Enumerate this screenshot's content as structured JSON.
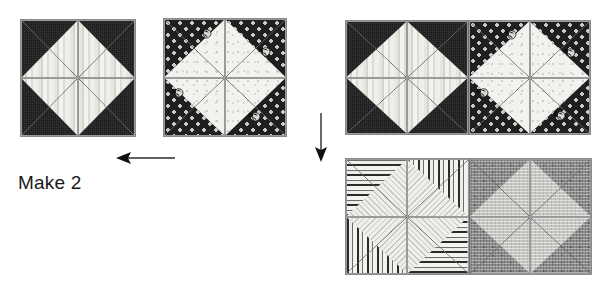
{
  "canvas": {
    "width": 602,
    "height": 288,
    "background": "#ffffff"
  },
  "instruction": {
    "label": "Make 2"
  },
  "colors": {
    "dark_solid": "#262626",
    "light_stripe": "#ebebe6",
    "dot_dark": "#1f1f1f",
    "light_speck": "#f2f2ee",
    "mottle_mid": "#8e8e8e",
    "mottle_light": "#c6c6c2",
    "seam": "#6a6a6a",
    "outline": "#8a8a8a",
    "text": "#1a1a1a",
    "arrow": "#2b2b2b"
  },
  "units": [
    {
      "id": "pinwheel-stripe",
      "name": "striped-pinwheel-block",
      "x": 20,
      "y": 19,
      "w": 116,
      "h": 118,
      "kind": "block",
      "quadrants": [
        {
          "pos": "top-left",
          "dark_corner": "tl",
          "dark_fabric": "fab-dark-solid",
          "light_fabric": "fab-light-stripe",
          "seam": "fwd",
          "motifs": []
        },
        {
          "pos": "top-right",
          "dark_corner": "tr",
          "dark_fabric": "fab-dark-solid",
          "light_fabric": "fab-light-stripe",
          "seam": "bwd",
          "motifs": []
        },
        {
          "pos": "bottom-left",
          "dark_corner": "bl",
          "dark_fabric": "fab-dark-solid",
          "light_fabric": "fab-light-stripe",
          "seam": "bwd",
          "motifs": []
        },
        {
          "pos": "bottom-right",
          "dark_corner": "br",
          "dark_fabric": "fab-dark-solid",
          "light_fabric": "fab-light-stripe",
          "seam": "fwd",
          "motifs": []
        }
      ]
    },
    {
      "id": "pinwheel-dot",
      "name": "polka-dot-pinwheel-block",
      "x": 163,
      "y": 18,
      "w": 124,
      "h": 119,
      "kind": "block",
      "quadrants": [
        {
          "pos": "top-left",
          "dark_corner": "tl",
          "dark_fabric": "fab-dot-dark",
          "light_fabric": "fab-light-speck",
          "seam": "fwd",
          "motifs": [
            {
              "x": 34,
              "y": 6
            }
          ]
        },
        {
          "pos": "top-right",
          "dark_corner": "tr",
          "dark_fabric": "fab-dot-dark",
          "light_fabric": "fab-light-speck",
          "seam": "bwd",
          "motifs": [
            {
              "x": 32,
              "y": 24
            }
          ]
        },
        {
          "pos": "bottom-left",
          "dark_corner": "bl",
          "dark_fabric": "fab-dot-dark",
          "light_fabric": "fab-light-speck",
          "seam": "bwd",
          "motifs": [
            {
              "x": 6,
              "y": 6
            }
          ]
        },
        {
          "pos": "bottom-right",
          "dark_corner": "br",
          "dark_fabric": "fab-dot-dark",
          "light_fabric": "fab-light-speck",
          "seam": "fwd",
          "motifs": [
            {
              "x": 22,
              "y": 30
            }
          ]
        }
      ]
    },
    {
      "id": "pair-top",
      "name": "joined-dark-pair-unit",
      "x": 345,
      "y": 20,
      "w": 246,
      "h": 115,
      "kind": "pair",
      "halves": [
        {
          "id": "pair-top-left",
          "name": "striped-pinwheel-half",
          "quadrants": [
            {
              "pos": "top-left",
              "dark_corner": "tl",
              "dark_fabric": "fab-dark-solid",
              "light_fabric": "fab-light-stripe",
              "seam": "fwd",
              "motifs": []
            },
            {
              "pos": "top-right",
              "dark_corner": "tr",
              "dark_fabric": "fab-dark-solid",
              "light_fabric": "fab-light-stripe",
              "seam": "bwd",
              "motifs": []
            },
            {
              "pos": "bottom-left",
              "dark_corner": "bl",
              "dark_fabric": "fab-dark-solid",
              "light_fabric": "fab-light-stripe",
              "seam": "bwd",
              "motifs": []
            },
            {
              "pos": "bottom-right",
              "dark_corner": "br",
              "dark_fabric": "fab-dark-solid",
              "light_fabric": "fab-light-stripe",
              "seam": "fwd",
              "motifs": []
            }
          ]
        },
        {
          "id": "pair-top-right",
          "name": "polka-dot-pinwheel-half",
          "quadrants": [
            {
              "pos": "top-left",
              "dark_corner": "tl",
              "dark_fabric": "fab-dot-dark",
              "light_fabric": "fab-light-speck",
              "seam": "fwd",
              "motifs": [
                {
                  "x": 34,
                  "y": 5
                }
              ]
            },
            {
              "pos": "top-right",
              "dark_corner": "tr",
              "dark_fabric": "fab-dot-dark",
              "light_fabric": "fab-light-speck",
              "seam": "bwd",
              "motifs": [
                {
                  "x": 32,
                  "y": 23
                }
              ]
            },
            {
              "pos": "bottom-left",
              "dark_corner": "bl",
              "dark_fabric": "fab-dot-dark",
              "light_fabric": "fab-light-speck",
              "seam": "bwd",
              "motifs": [
                {
                  "x": 6,
                  "y": 6
                }
              ]
            },
            {
              "pos": "bottom-right",
              "dark_corner": "br",
              "dark_fabric": "fab-dot-dark",
              "light_fabric": "fab-light-speck",
              "seam": "fwd",
              "motifs": [
                {
                  "x": 22,
                  "y": 29
                }
              ]
            }
          ]
        }
      ]
    },
    {
      "id": "pair-bottom",
      "name": "joined-light-pair-unit",
      "x": 345,
      "y": 158,
      "w": 247,
      "h": 117,
      "kind": "pair",
      "halves": [
        {
          "id": "pair-bottom-left",
          "name": "striped-light-pinwheel-half",
          "quadrants": [
            {
              "pos": "top-left",
              "dark_corner": "tl",
              "dark_fabric": "fab-hstripe-bold",
              "light_fabric": "fab-hatch-light",
              "seam": "fwd",
              "motifs": []
            },
            {
              "pos": "top-right",
              "dark_corner": "tr",
              "dark_fabric": "fab-vstripe-bold",
              "light_fabric": "fab-hatch-light-alt",
              "seam": "bwd",
              "motifs": []
            },
            {
              "pos": "bottom-left",
              "dark_corner": "bl",
              "dark_fabric": "fab-vstripe-bold",
              "light_fabric": "fab-hatch-light-alt",
              "seam": "bwd",
              "motifs": []
            },
            {
              "pos": "bottom-right",
              "dark_corner": "br",
              "dark_fabric": "fab-hstripe-bold",
              "light_fabric": "fab-hatch-light",
              "seam": "fwd",
              "motifs": []
            }
          ]
        },
        {
          "id": "pair-bottom-right",
          "name": "mottled-pinwheel-half",
          "quadrants": [
            {
              "pos": "top-left",
              "dark_corner": "tl",
              "dark_fabric": "fab-mottle-mid",
              "light_fabric": "fab-mottle-light",
              "seam": "fwd",
              "motifs": []
            },
            {
              "pos": "top-right",
              "dark_corner": "tr",
              "dark_fabric": "fab-mottle-mid",
              "light_fabric": "fab-mottle-light",
              "seam": "bwd",
              "motifs": []
            },
            {
              "pos": "bottom-left",
              "dark_corner": "bl",
              "dark_fabric": "fab-mottle-mid",
              "light_fabric": "fab-mottle-light",
              "seam": "bwd",
              "motifs": []
            },
            {
              "pos": "bottom-right",
              "dark_corner": "br",
              "dark_fabric": "fab-mottle-mid",
              "light_fabric": "fab-mottle-light",
              "seam": "fwd",
              "motifs": []
            }
          ]
        }
      ]
    }
  ],
  "arrows": [
    {
      "id": "arrow-left",
      "name": "arrow-left-icon",
      "direction": "left",
      "x": 114,
      "y": 150,
      "w": 62,
      "h": 16
    },
    {
      "id": "arrow-down",
      "name": "arrow-down-icon",
      "direction": "down",
      "x": 313,
      "y": 113,
      "w": 16,
      "h": 50
    }
  ],
  "label_position": {
    "x": 18,
    "y": 172
  }
}
